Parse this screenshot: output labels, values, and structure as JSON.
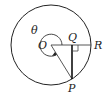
{
  "diagram": {
    "type": "circle-geometry",
    "labels": {
      "theta": "θ",
      "center": "O",
      "foot": "Q",
      "radius_end": "R",
      "point": "P"
    },
    "colors": {
      "stroke": "#222222",
      "background": "#ffffff"
    },
    "elements": [
      "outer circle centered at O",
      "horizontal radius O to R",
      "segment O to P",
      "perpendicular P to Q with right-angle marker",
      "reflex angle arc θ with arrow"
    ]
  }
}
